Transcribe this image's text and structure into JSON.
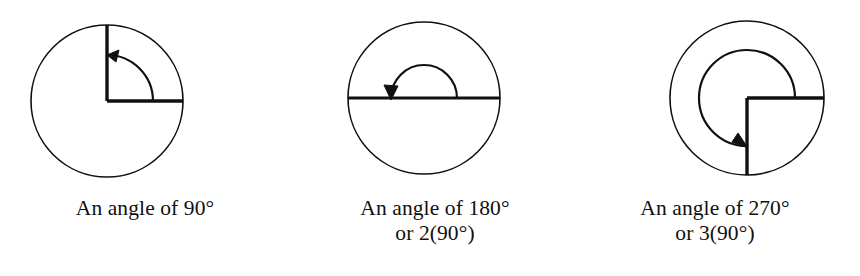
{
  "page": {
    "background_color": "#ffffff",
    "stroke_color": "#101010",
    "width": 860,
    "height": 276
  },
  "figures": [
    {
      "id": "angle-90",
      "caption_line1": "An angle of 90°",
      "caption_line2": "",
      "degrees": 90,
      "multiplier": 1,
      "circle": {
        "cx": 107,
        "cy": 101,
        "r": 76
      },
      "arc": {
        "r": 46,
        "start_deg": 0,
        "end_deg": 90,
        "direction": "counterclockwise"
      },
      "rays": [
        "right",
        "up"
      ]
    },
    {
      "id": "angle-180",
      "caption_line1": "An angle of 180°",
      "caption_line2": "or 2(90°)",
      "degrees": 180,
      "multiplier": 2,
      "circle": {
        "cx": 424,
        "cy": 98,
        "r": 76
      },
      "arc": {
        "r": 33,
        "start_deg": 0,
        "end_deg": 180,
        "direction": "counterclockwise"
      },
      "rays": [
        "right",
        "left"
      ]
    },
    {
      "id": "angle-270",
      "caption_line1": "An angle of 270°",
      "caption_line2": "or 3(90°)",
      "degrees": 270,
      "multiplier": 3,
      "circle": {
        "cx": 747,
        "cy": 98,
        "r": 77
      },
      "arc": {
        "r": 48,
        "start_deg": 0,
        "end_deg": 270,
        "direction": "counterclockwise"
      },
      "rays": [
        "right",
        "down"
      ]
    }
  ]
}
